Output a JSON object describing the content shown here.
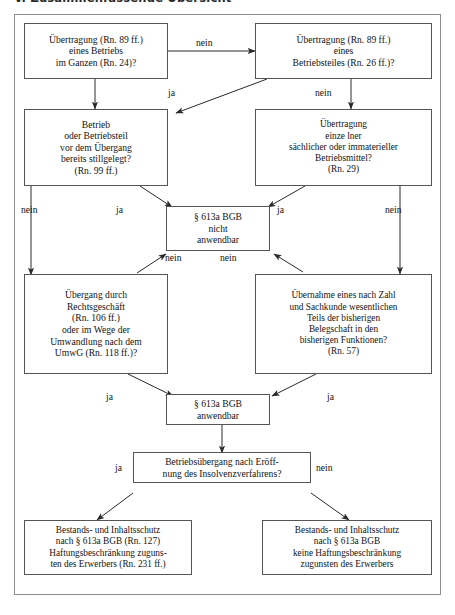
{
  "document": {
    "section_heading": "V. Zusammenfassende Übersicht"
  },
  "flowchart": {
    "type": "decision-flowchart",
    "title": "Betriebsübergang § 613a BGB Prüfungsschema",
    "nodes": [
      {
        "id": "uebertragung-betrieb",
        "label": "Übertragung (Rn. 89 ff.)\neines Betriebs\nim Ganzen (Rn. 24)?"
      },
      {
        "id": "uebertragung-betriebsteil",
        "label": "Übertragung (Rn. 89 ff.)\neines\nBetriebsteiles (Rn. 26 ff.)?"
      },
      {
        "id": "stillgelegt",
        "label": "Betrieb\noder Betriebsteil\nvor dem Übergang\nbereits stillgelegt?\n(Rn. 99 ff.)"
      },
      {
        "id": "betriebsmittel",
        "label": "Übertragung\neinze lner\nsächlicher oder immaterieller\nBetriebsmittel?\n(Rn. 29)"
      },
      {
        "id": "nicht-anwendbar",
        "label": "§ 613a BGB\nnicht\nanwendbar"
      },
      {
        "id": "rechtsgeschaeft",
        "label": "Übergang durch\nRechtsgeschäft\n(Rn. 106 ff.)\noder im Wege der\nUmwandlung nach dem\nUmwG (Rn. 118 ff.)?"
      },
      {
        "id": "belegschaft",
        "label": "Übernahme eines nach Zahl\nund Sachkunde wesentlichen\nTeils der bisherigen\nBelegschaft in den\nbisherigen Funktionen?\n(Rn. 57)"
      },
      {
        "id": "anwendbar",
        "label": "§ 613a BGB\nanwendbar"
      },
      {
        "id": "insolvenz",
        "label": "Betriebsübergang nach Eröff-\nnung des Insolvenzverfahrens?"
      },
      {
        "id": "ergebnis-insolvenz",
        "label": "Bestands- und Inhaltsschutz\nnach § 613a BGB (Rn. 127)\nHaftungsbeschränkung zuguns-\nten des Erwerbers (Rn. 231 ff.)"
      },
      {
        "id": "ergebnis-normal",
        "label": "Bestands- und Inhaltsschutz\nnach § 613a BGB\nkeine Haftungsbeschränkung\nzugunsten des Erwerbers"
      }
    ],
    "edge_labels": [
      {
        "id": "e1",
        "text": "nein"
      },
      {
        "id": "e2",
        "text": "ja"
      },
      {
        "id": "e3",
        "text": "nein"
      },
      {
        "id": "e4",
        "text": "nein"
      },
      {
        "id": "e5",
        "text": "ja"
      },
      {
        "id": "e6",
        "text": "ja"
      },
      {
        "id": "e7",
        "text": "nein"
      },
      {
        "id": "e8",
        "text": "nein"
      },
      {
        "id": "e9",
        "text": "nein"
      },
      {
        "id": "e10",
        "text": "ja"
      },
      {
        "id": "e11",
        "text": "ja"
      },
      {
        "id": "e12",
        "text": "ja"
      },
      {
        "id": "e13",
        "text": "nein"
      }
    ]
  }
}
